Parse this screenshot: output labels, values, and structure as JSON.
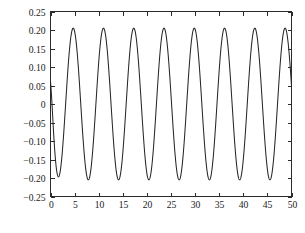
{
  "chart_data": {
    "type": "line",
    "title": "",
    "xlabel": "time/s",
    "ylabel": "Control input",
    "xlim": [
      0,
      50
    ],
    "ylim": [
      -0.25,
      0.25
    ],
    "xticks": [
      0,
      5,
      10,
      15,
      20,
      25,
      30,
      35,
      40,
      45,
      50
    ],
    "xtick_labels": [
      "0",
      "5",
      "10",
      "15",
      "20",
      "25",
      "30",
      "35",
      "40",
      "45",
      "50"
    ],
    "yticks": [
      -0.25,
      -0.2,
      -0.15,
      -0.1,
      -0.05,
      0,
      0.05,
      0.1,
      0.15,
      0.2,
      0.25
    ],
    "ytick_labels": [
      "−0.25",
      "−0.20",
      "−0.15",
      "−0.10",
      "−0.05",
      "0",
      "0.05",
      "0.10",
      "0.15",
      "0.20",
      "0.25"
    ],
    "grid": false,
    "legend": null,
    "series": [
      {
        "name": "control input",
        "color": "#262626",
        "line_width": 1.05,
        "description": "Sinusoidal control signal, amplitude about 0.205, period about 6.28 s (angular frequency 1 rad/s), negative-going sine after a short startup transient that spikes to about +0.06 near t = 0.",
        "amplitude": 0.205,
        "period": 6.28,
        "transient_peak": 0.06,
        "transient_duration": 1.1,
        "peak_times": [
          6.3,
          12.6,
          18.9,
          25.1,
          31.4,
          37.7,
          44.0
        ],
        "peak_value": 0.205,
        "trough_times": [
          3.1,
          9.4,
          15.7,
          22.0,
          28.3,
          34.6,
          40.9,
          47.1
        ],
        "trough_value": -0.207,
        "start_value": 0.0,
        "end_value": 0.2
      }
    ]
  }
}
